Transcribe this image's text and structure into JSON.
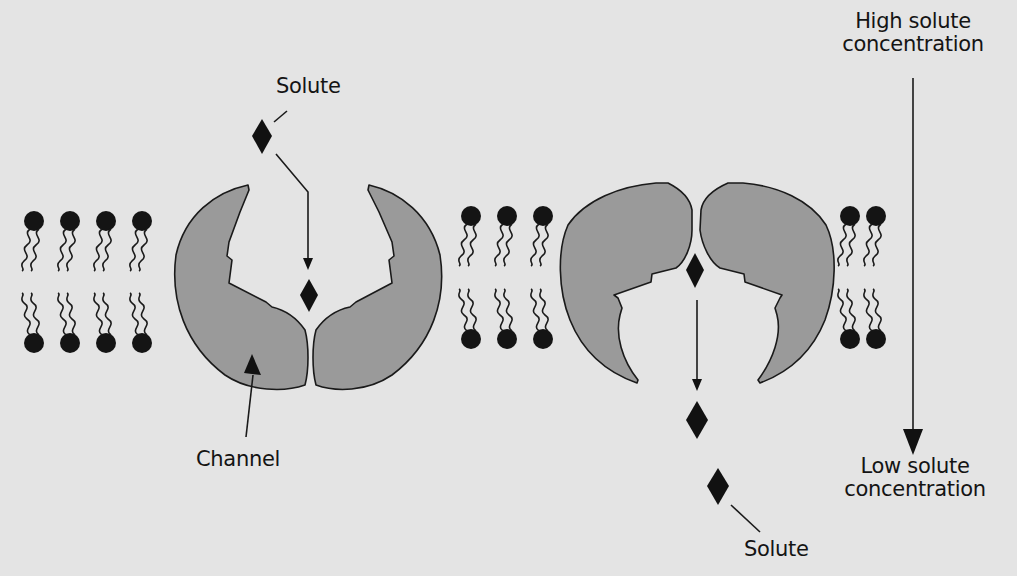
{
  "diagram": {
    "type": "membrane-channel-transport",
    "labels": {
      "solute_top": "Solute",
      "solute_bottom": "Solute",
      "channel": "Channel",
      "high_line1": "High solute",
      "high_line2": "concentration",
      "low_line1": "Low solute",
      "low_line2": "concentration"
    },
    "panels": [
      {
        "name": "closed-channel",
        "state": "solute entering channel from top",
        "lipids_left": 4,
        "lipids_right": 0
      },
      {
        "name": "open-channel",
        "state": "solute released below membrane",
        "lipids_left": 3,
        "lipids_right": 2
      }
    ],
    "gradient_arrow": {
      "from": "High solute concentration",
      "to": "Low solute concentration",
      "direction": "down"
    },
    "colors": {
      "background": "#e4e4e4",
      "protein_fill": "#9a9a9a",
      "outline": "#1a1a1a",
      "solute": "#111111",
      "text": "#141414"
    }
  }
}
